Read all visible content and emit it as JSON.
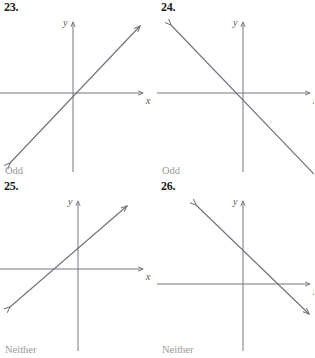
{
  "worksheet": {
    "title": "Even Odd Neither function graph identification",
    "axis_label_x": "x",
    "axis_label_y": "y",
    "line_color": "#70707a",
    "axis_color": "#76767e",
    "answer_color": "#9a9a9a",
    "number_color": "#1a1a1a"
  },
  "problems": [
    {
      "number": "23.",
      "answer": "Odd",
      "graph": {
        "type": "line",
        "description": "line through origin with positive slope",
        "slope": 1,
        "y_intercept": 0,
        "origin": {
          "x": 73,
          "y": 93
        },
        "x_axis": {
          "x1": 0,
          "x2": 147,
          "y": 93
        },
        "y_axis": {
          "x": 73,
          "y1": 18,
          "y2": 172
        },
        "line_endpoints": {
          "x1": 6,
          "y1": 167,
          "x2": 144,
          "y2": 22
        }
      }
    },
    {
      "number": "24.",
      "answer": "Odd",
      "graph": {
        "type": "line",
        "description": "line through origin with negative slope",
        "slope": -1,
        "y_intercept": 0,
        "origin": {
          "x": 86,
          "y": 93
        },
        "x_axis": {
          "x1": 0,
          "x2": 157,
          "y": 93
        },
        "y_axis": {
          "x": 86,
          "y1": 18,
          "y2": 172
        },
        "line_endpoints": {
          "x1": 10,
          "y1": 21,
          "x2": 155,
          "y2": 172
        }
      }
    },
    {
      "number": "25.",
      "answer": "Neither",
      "graph": {
        "type": "line",
        "description": "line with positive slope and positive y-intercept",
        "slope": 1,
        "y_intercept": 25,
        "origin": {
          "x": 78,
          "y": 89
        },
        "x_axis": {
          "x1": 0,
          "x2": 147,
          "y": 89
        },
        "y_axis": {
          "x": 78,
          "y1": 18,
          "y2": 172
        },
        "line_endpoints": {
          "x1": 6,
          "y1": 132,
          "x2": 131,
          "y2": 23
        }
      }
    },
    {
      "number": "26.",
      "answer": "Neither",
      "graph": {
        "type": "line",
        "description": "line with negative slope and positive y-intercept",
        "slope": -1,
        "y_intercept": 30,
        "origin": {
          "x": 86,
          "y": 105
        },
        "x_axis": {
          "x1": 0,
          "x2": 157,
          "y": 105
        },
        "y_axis": {
          "x": 86,
          "y1": 18,
          "y2": 172
        },
        "line_endpoints": {
          "x1": 35,
          "y1": 22,
          "x2": 152,
          "y2": 135
        }
      }
    }
  ]
}
